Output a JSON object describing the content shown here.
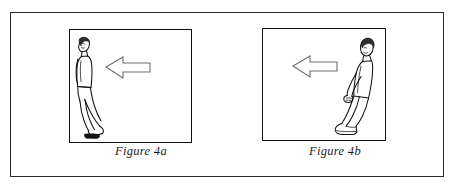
{
  "plate": {
    "name": "figure-plate",
    "background_color": "#ffffff",
    "frame_color": "#2b2b2b"
  },
  "panels": [
    {
      "id": "panel-a",
      "caption": "Figure 4a",
      "arrow": {
        "icon": "arrow-left-outline-icon",
        "direction": "left",
        "fill_color": "#ffffff",
        "stroke_color": "#6f6f6f"
      },
      "figure": {
        "icon": "walking-person-icon",
        "description": "line drawing of a person walking, seen from the side at the left edge of the panel",
        "position": "left",
        "facing": "left"
      },
      "border_color": "#111111"
    },
    {
      "id": "panel-b",
      "caption": "Figure 4b",
      "arrow": {
        "icon": "arrow-left-outline-icon",
        "direction": "left",
        "fill_color": "#ffffff",
        "stroke_color": "#6f6f6f"
      },
      "figure": {
        "icon": "walking-person-icon",
        "description": "line drawing of a person striding with leg extended at the right edge of the panel",
        "position": "right",
        "facing": "left"
      },
      "border_color": "#111111"
    }
  ]
}
